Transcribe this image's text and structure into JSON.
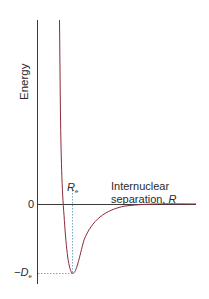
{
  "diagram": {
    "type": "potential-energy-curve",
    "title": "",
    "y_axis_label": "Energy",
    "x_axis_label_line1": "Internuclear",
    "x_axis_label_line2": "separation, ",
    "x_axis_symbol": "R",
    "zero_label": "0",
    "equilibrium_label": "R",
    "equilibrium_subscript": "e",
    "well_depth_label": "−D",
    "well_depth_subscript": "e",
    "colors": {
      "curve": "#8b2b3a",
      "axes": "#3a3a3a",
      "guides": "#7aa8c8",
      "text": "#2a2a2a"
    }
  }
}
